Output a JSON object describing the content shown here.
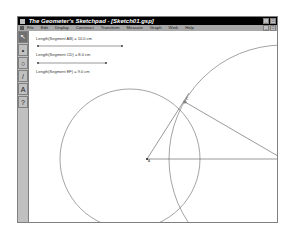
{
  "window": {
    "title": "The Geometer's Sketchpad - [Sketch01.gsp]",
    "title_buttons": [
      "minimize",
      "maximize"
    ],
    "mdi_buttons": [
      "minimize",
      "restore"
    ]
  },
  "menubar": {
    "items": [
      "File",
      "Edit",
      "Display",
      "Construct",
      "Transform",
      "Measure",
      "Graph",
      "Work",
      "Help"
    ]
  },
  "toolbox": {
    "tools": [
      {
        "name": "selection-arrow",
        "glyph": "↖",
        "active": true
      },
      {
        "name": "point",
        "glyph": "•",
        "active": false
      },
      {
        "name": "compass",
        "glyph": "○",
        "active": false
      },
      {
        "name": "straightedge",
        "glyph": "/",
        "active": false
      },
      {
        "name": "text",
        "glyph": "A",
        "active": false
      },
      {
        "name": "object-info",
        "glyph": "?",
        "active": false
      }
    ]
  },
  "measurements": [
    {
      "label": "Length(Segment AB) = 10.0 cm",
      "slider_endpoints": [
        "A",
        "B"
      ]
    },
    {
      "label": "Length(Segment CD) = 8.0 cm",
      "slider_endpoints": [
        "C",
        "D"
      ]
    },
    {
      "label": "Length(Segment EF) = 9.0 cm"
    }
  ],
  "points": [
    {
      "label": "A",
      "x": 118,
      "y": 128
    },
    {
      "label": "B",
      "x": 254,
      "y": 128
    },
    {
      "label": "C",
      "x": 156,
      "y": 71
    }
  ],
  "colors": {
    "titlebar": "#000000",
    "menubar": "#a8a8a8",
    "chrome": "#c0c0c0",
    "canvas": "#ffffff",
    "geometry": "#555555"
  }
}
